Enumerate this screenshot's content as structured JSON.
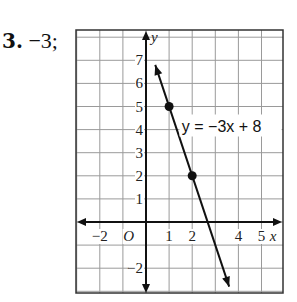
{
  "problem": {
    "number": "3.",
    "answer": "−3;"
  },
  "chart_data": {
    "type": "line",
    "title": "",
    "equation_label": "y = −3x + 8",
    "xlabel": "x",
    "ylabel": "y",
    "origin_label": "O",
    "x_ticks": [
      "−2",
      "1",
      "2",
      "4",
      "5"
    ],
    "y_ticks": [
      "7",
      "6",
      "5",
      "4",
      "3",
      "2",
      "1",
      "−2"
    ],
    "xlim": [
      -3,
      6
    ],
    "ylim": [
      -3,
      8
    ],
    "grid": true,
    "points": [
      {
        "x": 1,
        "y": 5
      },
      {
        "x": 2,
        "y": 2
      }
    ],
    "line": {
      "slope": -3,
      "intercept": 8,
      "x_start": 0.4,
      "x_end": 3.6
    }
  }
}
